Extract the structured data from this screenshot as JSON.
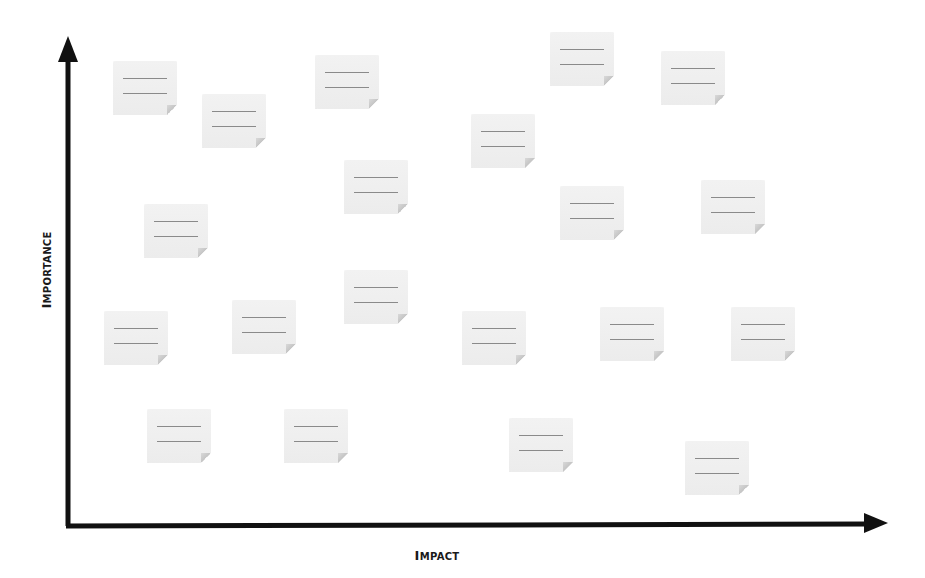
{
  "diagram": {
    "type": "prioritization-matrix",
    "x_axis": {
      "label_first": "I",
      "label_rest": "MPACT"
    },
    "y_axis": {
      "label_first": "I",
      "label_rest": "MPORTANCE"
    },
    "colors": {
      "axis": "#111111",
      "note_fill": "#efefef",
      "note_lines": "#8a8a8a",
      "background": "#ffffff"
    },
    "notes": [
      {
        "id": 1,
        "x": 113,
        "y": 61
      },
      {
        "id": 2,
        "x": 202,
        "y": 94
      },
      {
        "id": 3,
        "x": 315,
        "y": 55
      },
      {
        "id": 4,
        "x": 471,
        "y": 114
      },
      {
        "id": 5,
        "x": 550,
        "y": 32
      },
      {
        "id": 6,
        "x": 661,
        "y": 51
      },
      {
        "id": 7,
        "x": 344,
        "y": 160
      },
      {
        "id": 8,
        "x": 560,
        "y": 186
      },
      {
        "id": 9,
        "x": 701,
        "y": 180
      },
      {
        "id": 10,
        "x": 144,
        "y": 204
      },
      {
        "id": 11,
        "x": 104,
        "y": 311
      },
      {
        "id": 12,
        "x": 232,
        "y": 300
      },
      {
        "id": 13,
        "x": 344,
        "y": 270
      },
      {
        "id": 14,
        "x": 462,
        "y": 311
      },
      {
        "id": 15,
        "x": 600,
        "y": 307
      },
      {
        "id": 16,
        "x": 731,
        "y": 307
      },
      {
        "id": 17,
        "x": 147,
        "y": 409
      },
      {
        "id": 18,
        "x": 284,
        "y": 409
      },
      {
        "id": 19,
        "x": 509,
        "y": 418
      },
      {
        "id": 20,
        "x": 685,
        "y": 441
      }
    ]
  }
}
